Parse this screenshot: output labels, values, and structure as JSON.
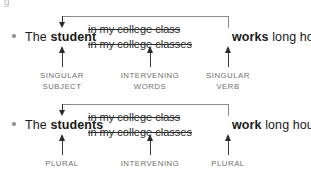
{
  "artifact_text": "g",
  "examples": [
    {
      "id": "singular",
      "bullet": "•",
      "subject_prefix": "The ",
      "subject_bold": "student",
      "intervening_line1": "in my college class",
      "intervening_line2": "in my college classes",
      "verb_bold": "works",
      "predicate_rest": " long hours.",
      "annotations": [
        {
          "line1": "SINGULAR",
          "line2": "SUBJECT"
        },
        {
          "line1": "INTERVENING",
          "line2": "WORDS"
        },
        {
          "line1": "SINGULAR",
          "line2": "VERB"
        }
      ]
    },
    {
      "id": "plural",
      "bullet": "•",
      "subject_prefix": "The ",
      "subject_bold": "students",
      "intervening_line1": "in my college class",
      "intervening_line2": "in my college classes",
      "verb_bold": "work",
      "predicate_rest": " long hours.",
      "annotations": [
        {
          "line1": "PLURAL",
          "line2": ""
        },
        {
          "line1": "INTERVENING",
          "line2": ""
        },
        {
          "line1": "PLURAL",
          "line2": ""
        }
      ]
    }
  ],
  "colors": {
    "text": "#1a1a1a",
    "label": "#6f6f6f",
    "bracket": "#8a8a8a",
    "arrow": "#2b2b2b",
    "bullet": "#8c8c8c",
    "background": "#ffffff"
  }
}
